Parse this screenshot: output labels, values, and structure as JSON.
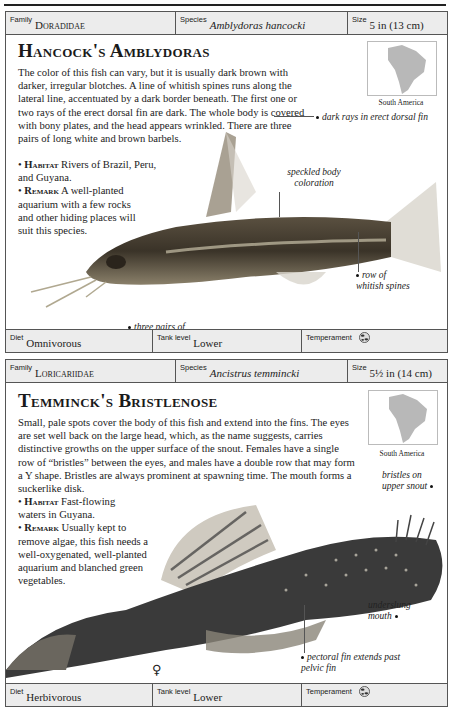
{
  "cards": [
    {
      "header": {
        "family_label": "Family",
        "family": "Doradidae",
        "species_label": "Species",
        "species": "Amblydoras hancocki",
        "size_label": "Size",
        "size": "5 in (13 cm)"
      },
      "title": "Hancock's Amblydoras",
      "description": "The color of this fish can vary, but it is usually dark brown with darker, irregular blotches. A line of whitish spines runs along the lateral line, accentuated by a dark border beneath. The first one or two rays of the erect dorsal fin are dark. The whole body is covered with bony plates, and the head appears wrinkled. There are three pairs of long white and brown barbels.",
      "habitat_label": "Habitat",
      "habitat": "Rivers of Brazil, Peru, and Guyana.",
      "remark_label": "Remark",
      "remark": "A well-planted aquarium with a few rocks and other hiding places will suit this species.",
      "map_label": "South America",
      "callouts": [
        "dark rays in erect dorsal fin",
        "speckled body coloration",
        "row of whitish spines",
        "three pairs of barbels"
      ],
      "footer": {
        "diet_label": "Diet",
        "diet": "Omnivorous",
        "tank_label": "Tank level",
        "tank": "Lower",
        "temperament_label": "Temperament",
        "temperament_icon": "peaceful-fish-icon"
      }
    },
    {
      "header": {
        "family_label": "Family",
        "family": "Loricariidae",
        "species_label": "Species",
        "species": "Ancistrus temmincki",
        "size_label": "Size",
        "size": "5½ in (14 cm)"
      },
      "title": "Temminck's Bristlenose",
      "description": "Small, pale spots cover the body of this fish and extend into the fins. The eyes are set well back on the large head, which, as the name suggests, carries distinctive growths on the upper surface of the snout. Females have a single row of “bristles” between the eyes, and males have a double row that may form a Y shape. Bristles are always prominent at spawning time. The mouth forms a suckerlike disk.",
      "habitat_label": "Habitat",
      "habitat": "Fast-flowing waters in Guyana.",
      "remark_label": "Remark",
      "remark": "Usually kept to remove algae, this fish needs a well-oxygenated, well-planted aquarium and blanched green vegetables.",
      "map_label": "South America",
      "callouts": [
        "bristles on upper snout",
        "underslung mouth",
        "pectoral fin extends past pelvic fin"
      ],
      "sex_symbol": "♀",
      "footer": {
        "diet_label": "Diet",
        "diet": "Herbivorous",
        "tank_label": "Tank level",
        "tank": "Lower",
        "temperament_label": "Temperament",
        "temperament_icon": "peaceful-fish-icon"
      }
    }
  ]
}
